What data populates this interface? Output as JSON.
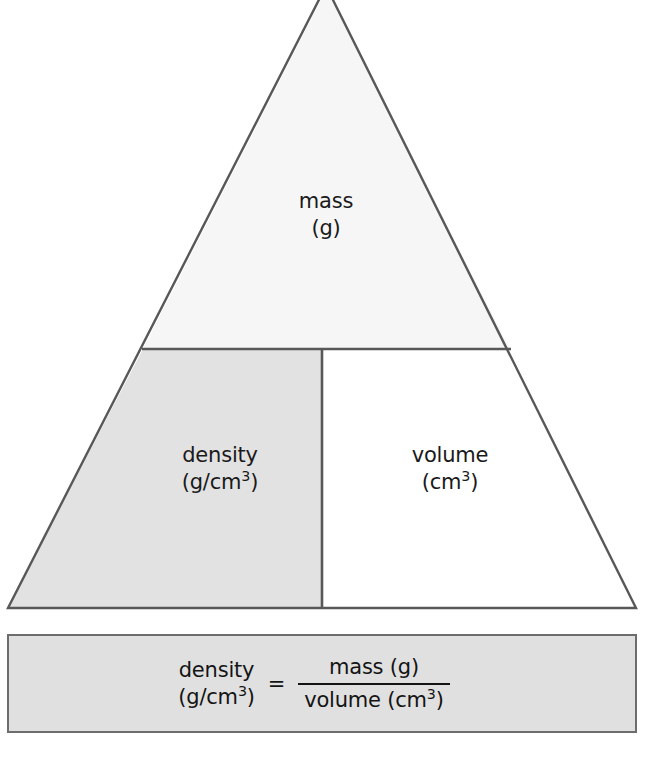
{
  "diagram": {
    "type": "density-formula-triangle",
    "title": "",
    "regions": [
      {
        "id": "mass",
        "name": "mass",
        "quantity": "mass",
        "unit_prefix": "(g",
        "unit_suffix": ")",
        "unit_exponent": "",
        "unit_full": "(g)",
        "fill": "#f6f6f6",
        "position": "top"
      },
      {
        "id": "density",
        "name": "density",
        "quantity": "density",
        "unit_prefix": "(g/cm",
        "unit_exponent": "3",
        "unit_suffix": ")",
        "unit_full": "(g/cm3)",
        "fill": "#e2e2e2",
        "position": "bottom-left"
      },
      {
        "id": "volume",
        "name": "volume",
        "quantity": "volume",
        "unit_prefix": "(cm",
        "unit_exponent": "3",
        "unit_suffix": ")",
        "unit_full": "(cm3)",
        "fill": "#ffffff",
        "position": "bottom-right"
      }
    ],
    "stroke_color": "#585858",
    "stroke_width": 2
  },
  "formula": {
    "lhs_line1": "density",
    "lhs_unit_prefix": "(g/cm",
    "lhs_unit_exponent": "3",
    "lhs_unit_suffix": ")",
    "equals": "=",
    "numerator": "mass (g)",
    "denominator_prefix": "volume (cm",
    "denominator_exponent": "3",
    "denominator_suffix": ")",
    "box_fill": "#e0e0e0",
    "box_border": "#6d6d6d"
  }
}
